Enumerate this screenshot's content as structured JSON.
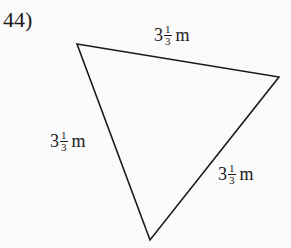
{
  "problem": {
    "number": "44)"
  },
  "figure": {
    "shape": "triangle",
    "stroke_color": "#1a1a1a",
    "fill_color": "none",
    "vertices": [
      [
        77,
        44
      ],
      [
        279,
        77
      ],
      [
        150,
        240
      ]
    ],
    "sides": [
      {
        "id": "top",
        "whole": "3",
        "numerator": "1",
        "denominator": "3",
        "unit": "m"
      },
      {
        "id": "left",
        "whole": "3",
        "numerator": "1",
        "denominator": "3",
        "unit": "m"
      },
      {
        "id": "right",
        "whole": "3",
        "numerator": "1",
        "denominator": "3",
        "unit": "m"
      }
    ]
  }
}
